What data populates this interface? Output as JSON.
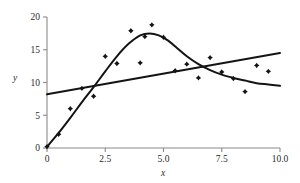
{
  "chart_data": {
    "type": "scatter",
    "title": "",
    "xlabel": "x",
    "ylabel": "y",
    "xlim": [
      0,
      10
    ],
    "ylim": [
      0,
      20
    ],
    "grid": false,
    "legend": "none",
    "xticks": [
      0,
      2.5,
      5.0,
      7.5,
      10.0
    ],
    "xticklabels": [
      "0",
      "2.5",
      "5.0",
      "7.5",
      "10.0"
    ],
    "yticks": [
      0,
      5,
      10,
      15,
      20
    ],
    "yticklabels": [
      "0",
      "5",
      "10",
      "15",
      "20"
    ],
    "points": [
      {
        "x": 0.0,
        "y": 0.2
      },
      {
        "x": 0.5,
        "y": 2.1
      },
      {
        "x": 1.0,
        "y": 6.0
      },
      {
        "x": 1.5,
        "y": 9.1
      },
      {
        "x": 2.0,
        "y": 7.9
      },
      {
        "x": 2.5,
        "y": 14.0
      },
      {
        "x": 3.0,
        "y": 12.9
      },
      {
        "x": 3.6,
        "y": 17.9
      },
      {
        "x": 4.0,
        "y": 13.0
      },
      {
        "x": 4.2,
        "y": 17.0
      },
      {
        "x": 4.5,
        "y": 18.8
      },
      {
        "x": 5.0,
        "y": 16.9
      },
      {
        "x": 5.5,
        "y": 11.8
      },
      {
        "x": 6.0,
        "y": 12.8
      },
      {
        "x": 6.5,
        "y": 10.7
      },
      {
        "x": 7.0,
        "y": 13.8
      },
      {
        "x": 7.5,
        "y": 11.6
      },
      {
        "x": 8.0,
        "y": 10.6
      },
      {
        "x": 8.5,
        "y": 8.6
      },
      {
        "x": 9.0,
        "y": 12.6
      },
      {
        "x": 9.5,
        "y": 11.7
      }
    ],
    "series": [
      {
        "name": "linear-fit",
        "type": "line",
        "shape": "straight",
        "points": [
          {
            "x": 0.0,
            "y": 8.2
          },
          {
            "x": 10.0,
            "y": 14.5
          }
        ]
      },
      {
        "name": "smooth-fit",
        "type": "line",
        "shape": "curve",
        "points": [
          {
            "x": 0.0,
            "y": 0.2
          },
          {
            "x": 0.5,
            "y": 2.3
          },
          {
            "x": 1.0,
            "y": 4.6
          },
          {
            "x": 1.5,
            "y": 7.0
          },
          {
            "x": 2.0,
            "y": 9.3
          },
          {
            "x": 2.5,
            "y": 11.7
          },
          {
            "x": 3.0,
            "y": 14.0
          },
          {
            "x": 3.5,
            "y": 15.9
          },
          {
            "x": 4.0,
            "y": 17.2
          },
          {
            "x": 4.4,
            "y": 17.5
          },
          {
            "x": 4.8,
            "y": 17.2
          },
          {
            "x": 5.2,
            "y": 16.4
          },
          {
            "x": 5.6,
            "y": 15.2
          },
          {
            "x": 6.0,
            "y": 14.0
          },
          {
            "x": 6.5,
            "y": 12.8
          },
          {
            "x": 7.0,
            "y": 11.9
          },
          {
            "x": 7.5,
            "y": 11.2
          },
          {
            "x": 8.0,
            "y": 10.7
          },
          {
            "x": 8.5,
            "y": 10.3
          },
          {
            "x": 9.0,
            "y": 9.9
          },
          {
            "x": 9.5,
            "y": 9.7
          },
          {
            "x": 10.0,
            "y": 9.5
          }
        ]
      }
    ],
    "colors": {
      "axis": "#8a8a8a",
      "ink": "#141414",
      "background": "#ffffff"
    }
  }
}
